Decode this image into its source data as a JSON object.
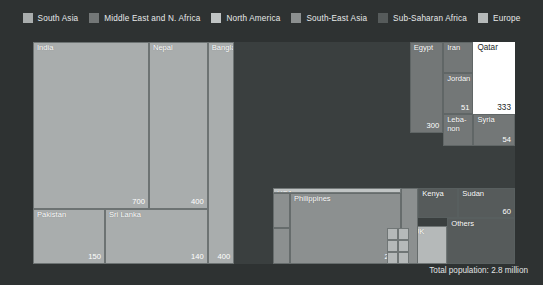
{
  "legend": {
    "items": [
      {
        "label": "South Asia",
        "color": "#a9adad"
      },
      {
        "label": "Middle East and N. Africa",
        "color": "#737777"
      },
      {
        "label": "North America",
        "color": "#c0c4c4"
      },
      {
        "label": "South-East Asia",
        "color": "#8c9090"
      },
      {
        "label": "Sub-Saharan Africa",
        "color": "#565b5b"
      },
      {
        "label": "Europe",
        "color": "#b5b9b9"
      }
    ]
  },
  "footer": {
    "total_population": "Total population: 2.8 million"
  },
  "chart_data": {
    "type": "treemap",
    "title": "",
    "total_label": "Total population: 2.8 million",
    "value_unit": "thousand people",
    "groups": [
      "South Asia",
      "Middle East and N. Africa",
      "North America",
      "South-East Asia",
      "Sub-Saharan Africa",
      "Europe"
    ],
    "group_colors": {
      "South Asia": "#a9adad",
      "Middle East and N. Africa": "#737777",
      "North America": "#c0c4c4",
      "South-East Asia": "#8c9090",
      "Sub-Saharan Africa": "#565b5b",
      "Europe": "#b5b9b9"
    },
    "highlighted": "Qatar",
    "highlight_color": "#ffffff",
    "nodes": [
      {
        "label": "India",
        "value": 700,
        "value_text": "700",
        "group": "South Asia",
        "x": 0,
        "y": 0,
        "w": 48.3,
        "h": 75.2,
        "show_value": true
      },
      {
        "label": "Nepal",
        "value": 400,
        "value_text": "400",
        "group": "South Asia",
        "x": 48.3,
        "y": 0,
        "w": 24.5,
        "h": 75.2,
        "show_value": true
      },
      {
        "label": "Bangladesh",
        "value": 400,
        "value_text": "400",
        "group": "South Asia",
        "x": 72.8,
        "y": 0,
        "w": 11.0,
        "h": 100,
        "show_value": true
      },
      {
        "label": "Pakistan",
        "value": 150,
        "value_text": "150",
        "group": "South Asia",
        "x": 0,
        "y": 75.2,
        "w": 30.0,
        "h": 24.8,
        "show_value": true
      },
      {
        "label": "Sri Lanka",
        "value": 140,
        "value_text": "140",
        "group": "South Asia",
        "x": 30.0,
        "y": 75.2,
        "w": 42.8,
        "h": 24.8,
        "show_value": true
      },
      {
        "label": "Egypt",
        "value": 300,
        "value_text": "300",
        "group": "Middle East and N. Africa",
        "x": 56.5,
        "y": 0,
        "w": 13.8,
        "h": 62.0,
        "show_value": true,
        "pane": "right"
      },
      {
        "label": "Iran",
        "value": null,
        "value_text": "",
        "group": "Middle East and N. Africa",
        "x": 70.3,
        "y": 0,
        "w": 12.5,
        "h": 21.0,
        "show_value": false,
        "pane": "right"
      },
      {
        "label": "Jordan",
        "value": 51,
        "value_text": "51",
        "group": "Middle East and N. Africa",
        "x": 70.3,
        "y": 21.0,
        "w": 12.5,
        "h": 28.5,
        "show_value": true,
        "pane": "right"
      },
      {
        "label": "Leba-\nnon",
        "value": null,
        "value_text": "",
        "group": "Middle East and N. Africa",
        "x": 70.3,
        "y": 49.5,
        "w": 12.5,
        "h": 22.0,
        "show_value": false,
        "pane": "right"
      },
      {
        "label": "Qatar",
        "value": 333,
        "value_text": "333",
        "group": "Middle East and N. Africa",
        "x": 82.8,
        "y": 0,
        "w": 17.2,
        "h": 49.5,
        "show_value": true,
        "pane": "right",
        "highlight": true
      },
      {
        "label": "Syria",
        "value": 54,
        "value_text": "54",
        "group": "Middle East and N. Africa",
        "x": 82.8,
        "y": 49.5,
        "w": 17.2,
        "h": 22.0,
        "show_value": true,
        "pane": "right"
      },
      {
        "label": "USA",
        "value": null,
        "value_text": "",
        "group": "North America",
        "x": 0,
        "y": 0,
        "w": 53.0,
        "h": 6.5,
        "show_value": false,
        "pane": "bottom"
      },
      {
        "label": "Philippines",
        "value": 236,
        "value_text": "236",
        "group": "South-East Asia",
        "x": 7.0,
        "y": 6.5,
        "w": 46.0,
        "h": 93.5,
        "show_value": true,
        "pane": "bottom"
      },
      {
        "label": "Kenya",
        "value": null,
        "value_text": "",
        "group": "Sub-Saharan Africa",
        "x": 60.0,
        "y": 0,
        "w": 16.5,
        "h": 40.0,
        "show_value": false,
        "pane": "bottom"
      },
      {
        "label": "Sudan",
        "value": 60,
        "value_text": "60",
        "group": "Sub-Saharan Africa",
        "x": 76.5,
        "y": 0,
        "w": 23.5,
        "h": 40.0,
        "show_value": true,
        "pane": "bottom"
      },
      {
        "label": "Others",
        "value": null,
        "value_text": "",
        "group": "Sub-Saharan Africa",
        "x": 72.0,
        "y": 40.0,
        "w": 28.0,
        "h": 60.0,
        "show_value": false,
        "pane": "bottom"
      },
      {
        "label": "UK",
        "value": null,
        "value_text": "",
        "group": "Europe",
        "x": 56.5,
        "y": 50.0,
        "w": 15.5,
        "h": 50.0,
        "show_value": false,
        "pane": "bottom"
      }
    ]
  }
}
